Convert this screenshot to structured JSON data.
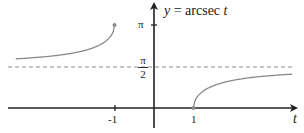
{
  "chart_data": {
    "type": "line",
    "title": "y = arcsec t",
    "title_parts": {
      "lhs": "y",
      "eq": " = arcsec ",
      "var": "t"
    },
    "xlabel": "t",
    "ylabel": "y",
    "x_ticks": [
      {
        "value": -1,
        "label": "-1"
      },
      {
        "value": 1,
        "label": "1"
      }
    ],
    "y_ticks": [
      {
        "value": 1.5708,
        "label": "π/2",
        "numerator": "π",
        "denominator": "2"
      },
      {
        "value": 3.1416,
        "label": "π"
      }
    ],
    "asymptote": {
      "y": 1.5708,
      "style": "dashed",
      "label": "π/2"
    },
    "series": [
      {
        "name": "arcsec t (t ≤ -1)",
        "domain": [
          -3.5,
          -1
        ],
        "endpoint": {
          "t": -1,
          "y": 3.1416,
          "closed": true
        },
        "points": [
          [
            -3.5,
            1.8607
          ],
          [
            -3,
            1.9106
          ],
          [
            -2.5,
            1.9823
          ],
          [
            -2,
            2.0944
          ],
          [
            -1.5,
            2.3005
          ],
          [
            -1.2,
            2.5559
          ],
          [
            -1.05,
            2.8307
          ],
          [
            -1,
            3.1416
          ]
        ]
      },
      {
        "name": "arcsec t (t ≥ 1)",
        "domain": [
          1,
          3.5
        ],
        "endpoint": {
          "t": 1,
          "y": 0,
          "closed": true
        },
        "points": [
          [
            1,
            0
          ],
          [
            1.05,
            0.3109
          ],
          [
            1.2,
            0.5857
          ],
          [
            1.5,
            0.8411
          ],
          [
            2,
            1.0472
          ],
          [
            2.5,
            1.1593
          ],
          [
            3,
            1.231
          ],
          [
            3.5,
            1.281
          ]
        ]
      }
    ],
    "colors": {
      "axis": "#222222",
      "curve": "#8a8a8a",
      "asymptote": "#8a8a8a"
    },
    "grid": false,
    "legend": null
  }
}
